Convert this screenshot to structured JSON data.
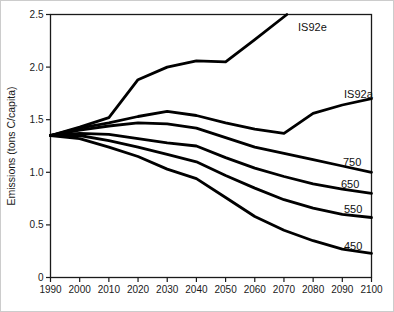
{
  "figure": {
    "background_color": "#ffffff",
    "line_color": "#000000",
    "axis_color": "#1a1a1a",
    "text_color": "#1a1a1a"
  },
  "chart_data": {
    "type": "line",
    "title": "",
    "xlabel": "",
    "ylabel": "Emissions (tons C/capita)",
    "xlim": [
      1990,
      2100
    ],
    "ylim": [
      0,
      2.5
    ],
    "grid": false,
    "legend_position": "inline-end-labels",
    "x_ticks": [
      1990,
      2000,
      2010,
      2020,
      2030,
      2040,
      2050,
      2060,
      2070,
      2080,
      2090,
      2100
    ],
    "x_tick_labels": [
      "1990",
      "2000",
      "2010",
      "2020",
      "2030",
      "2040",
      "2050",
      "2060",
      "2070",
      "2080",
      "2090",
      "2100"
    ],
    "y_ticks": [
      0,
      0.5,
      1.0,
      1.5,
      2.0,
      2.5
    ],
    "y_tick_labels": [
      "0",
      "0.5",
      "1.0",
      "1.5",
      "2.0",
      "2.5"
    ],
    "series": [
      {
        "name": "IS92e",
        "x": [
          1990,
          2000,
          2010,
          2020,
          2030,
          2040,
          2050,
          2060,
          2071
        ],
        "values": [
          1.35,
          1.43,
          1.52,
          1.88,
          2.0,
          2.06,
          2.05,
          2.26,
          2.5
        ]
      },
      {
        "name": "IS92a",
        "x": [
          1990,
          2000,
          2010,
          2020,
          2030,
          2040,
          2050,
          2060,
          2070,
          2080,
          2090,
          2100
        ],
        "values": [
          1.35,
          1.42,
          1.47,
          1.53,
          1.58,
          1.54,
          1.47,
          1.41,
          1.37,
          1.56,
          1.64,
          1.7
        ]
      },
      {
        "name": "750",
        "x": [
          1990,
          2000,
          2010,
          2020,
          2030,
          2040,
          2050,
          2060,
          2070,
          2080,
          2090,
          2100
        ],
        "values": [
          1.35,
          1.4,
          1.44,
          1.47,
          1.46,
          1.42,
          1.33,
          1.24,
          1.18,
          1.12,
          1.06,
          1.0
        ]
      },
      {
        "name": "650",
        "x": [
          1990,
          2000,
          2010,
          2020,
          2030,
          2040,
          2050,
          2060,
          2070,
          2080,
          2090,
          2100
        ],
        "values": [
          1.35,
          1.37,
          1.36,
          1.32,
          1.28,
          1.25,
          1.14,
          1.04,
          0.96,
          0.89,
          0.84,
          0.8
        ]
      },
      {
        "name": "550",
        "x": [
          1990,
          2000,
          2010,
          2020,
          2030,
          2040,
          2050,
          2060,
          2070,
          2080,
          2090,
          2100
        ],
        "values": [
          1.35,
          1.35,
          1.3,
          1.24,
          1.17,
          1.1,
          0.97,
          0.85,
          0.74,
          0.66,
          0.6,
          0.57
        ]
      },
      {
        "name": "450",
        "x": [
          1990,
          2000,
          2010,
          2020,
          2030,
          2040,
          2050,
          2060,
          2070,
          2080,
          2090,
          2100
        ],
        "values": [
          1.35,
          1.32,
          1.24,
          1.15,
          1.03,
          0.94,
          0.76,
          0.58,
          0.45,
          0.35,
          0.27,
          0.23
        ]
      }
    ]
  }
}
